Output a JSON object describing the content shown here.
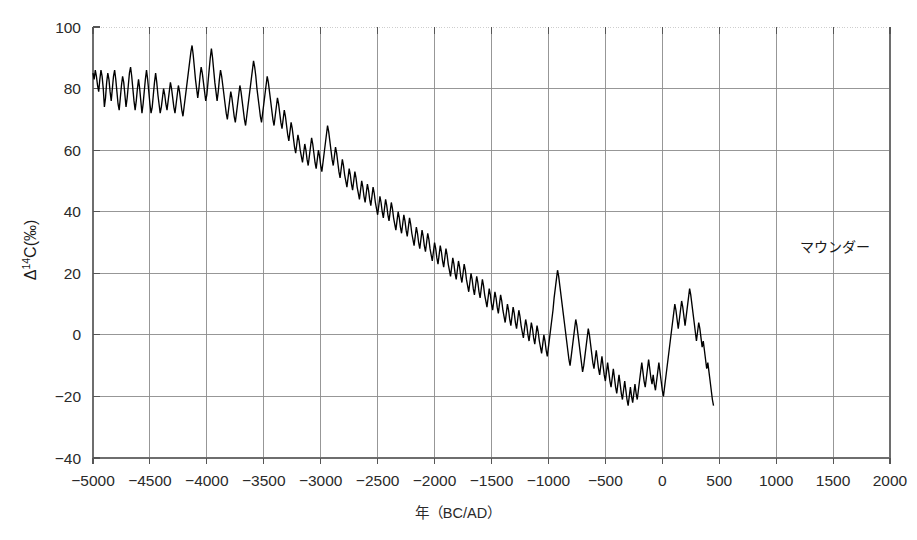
{
  "chart_data": {
    "type": "line",
    "title": "",
    "xlabel": "年（BC/AD）",
    "ylabel": "Δ14C(‰)",
    "ylabel_parts": {
      "delta": "Δ",
      "superscript": "14",
      "rest": "C(‰)"
    },
    "xlim": [
      -5000,
      2000
    ],
    "ylim": [
      -40,
      100
    ],
    "grid": true,
    "legend": false,
    "xtick_labels": [
      "−5000",
      "−4500",
      "−4000",
      "−3500",
      "−3000",
      "−2500",
      "−2000",
      "−1500",
      "−1000",
      "−500",
      "0",
      "500",
      "1000",
      "1500",
      "2000"
    ],
    "xtick_values": [
      -5000,
      -4500,
      -4000,
      -3500,
      -3000,
      -2500,
      -2000,
      -1500,
      -1000,
      -500,
      0,
      500,
      1000,
      1500,
      2000
    ],
    "ytick_labels": [
      "100",
      "80",
      "60",
      "40",
      "20",
      "0",
      "−20",
      "−40"
    ],
    "ytick_values": [
      100,
      80,
      60,
      40,
      20,
      0,
      -20,
      -40
    ],
    "annotations": [
      {
        "text": "マウンダー",
        "x": 1520,
        "y": 27,
        "name": "maunder-annotation"
      }
    ],
    "series": [
      {
        "name": "Delta-14C",
        "color": "#000000",
        "x_start": -5000,
        "x_step": 10,
        "values": [
          85,
          83,
          86,
          84,
          81,
          79,
          83,
          86,
          84,
          80,
          74,
          77,
          82,
          85,
          83,
          79,
          76,
          80,
          84,
          86,
          83,
          79,
          75,
          73,
          77,
          81,
          84,
          82,
          78,
          74,
          77,
          81,
          85,
          87,
          84,
          80,
          76,
          73,
          76,
          80,
          83,
          80,
          76,
          72,
          75,
          79,
          83,
          86,
          83,
          79,
          75,
          72,
          74,
          78,
          82,
          85,
          82,
          78,
          75,
          72,
          74,
          77,
          80,
          78,
          75,
          73,
          76,
          79,
          82,
          80,
          77,
          74,
          72,
          75,
          78,
          81,
          79,
          76,
          73,
          71,
          74,
          77,
          80,
          83,
          86,
          89,
          92,
          94,
          91,
          87,
          83,
          80,
          77,
          80,
          84,
          87,
          85,
          82,
          79,
          76,
          78,
          82,
          86,
          90,
          93,
          90,
          86,
          82,
          79,
          76,
          79,
          83,
          86,
          84,
          81,
          78,
          75,
          72,
          70,
          73,
          76,
          79,
          77,
          74,
          71,
          69,
          72,
          75,
          78,
          81,
          79,
          76,
          73,
          70,
          68,
          71,
          74,
          77,
          80,
          83,
          86,
          89,
          87,
          84,
          80,
          77,
          74,
          71,
          69,
          72,
          75,
          78,
          81,
          84,
          82,
          79,
          76,
          73,
          70,
          68,
          71,
          74,
          77,
          75,
          72,
          69,
          67,
          70,
          73,
          71,
          68,
          65,
          63,
          66,
          69,
          67,
          64,
          61,
          59,
          62,
          65,
          63,
          60,
          58,
          56,
          59,
          62,
          60,
          57,
          55,
          58,
          61,
          64,
          62,
          59,
          56,
          54,
          57,
          60,
          58,
          55,
          53,
          56,
          59,
          62,
          65,
          68,
          66,
          63,
          60,
          57,
          55,
          58,
          61,
          59,
          56,
          53,
          51,
          54,
          57,
          55,
          52,
          50,
          48,
          51,
          54,
          52,
          49,
          47,
          50,
          53,
          51,
          48,
          46,
          44,
          47,
          50,
          48,
          45,
          43,
          46,
          49,
          47,
          44,
          42,
          45,
          48,
          46,
          43,
          41,
          39,
          42,
          45,
          43,
          40,
          38,
          41,
          44,
          42,
          39,
          37,
          40,
          43,
          41,
          38,
          36,
          34,
          37,
          40,
          38,
          35,
          33,
          36,
          39,
          37,
          34,
          32,
          35,
          38,
          36,
          33,
          31,
          29,
          32,
          35,
          33,
          30,
          28,
          31,
          34,
          32,
          29,
          27,
          30,
          33,
          31,
          28,
          26,
          24,
          27,
          30,
          28,
          25,
          23,
          26,
          29,
          27,
          24,
          22,
          25,
          28,
          26,
          23,
          21,
          19,
          22,
          25,
          23,
          20,
          18,
          21,
          24,
          22,
          19,
          17,
          20,
          23,
          21,
          18,
          16,
          14,
          17,
          20,
          18,
          15,
          13,
          16,
          19,
          17,
          14,
          12,
          15,
          18,
          16,
          13,
          11,
          9,
          12,
          15,
          13,
          10,
          8,
          11,
          14,
          12,
          9,
          7,
          10,
          13,
          11,
          8,
          6,
          4,
          7,
          10,
          8,
          5,
          3,
          6,
          9,
          7,
          4,
          2,
          5,
          8,
          6,
          3,
          1,
          -1,
          2,
          5,
          3,
          0,
          -2,
          1,
          4,
          2,
          -1,
          -3,
          0,
          3,
          1,
          -2,
          -4,
          -6,
          -3,
          0,
          -2,
          -5,
          -7,
          -4,
          -1,
          2,
          5,
          8,
          12,
          15,
          18,
          21,
          19,
          16,
          13,
          10,
          7,
          4,
          1,
          -2,
          -5,
          -8,
          -10,
          -7,
          -4,
          -1,
          2,
          5,
          3,
          0,
          -3,
          -6,
          -9,
          -12,
          -10,
          -7,
          -4,
          -1,
          2,
          0,
          -3,
          -6,
          -9,
          -11,
          -8,
          -5,
          -8,
          -11,
          -13,
          -10,
          -7,
          -10,
          -13,
          -15,
          -12,
          -9,
          -12,
          -15,
          -17,
          -14,
          -11,
          -14,
          -17,
          -19,
          -16,
          -13,
          -16,
          -19,
          -21,
          -18,
          -15,
          -18,
          -21,
          -23,
          -20,
          -17,
          -20,
          -22,
          -19,
          -16,
          -19,
          -21,
          -18,
          -15,
          -12,
          -9,
          -12,
          -15,
          -17,
          -14,
          -11,
          -8,
          -11,
          -14,
          -16,
          -13,
          -16,
          -18,
          -15,
          -12,
          -9,
          -12,
          -15,
          -18,
          -20,
          -17,
          -14,
          -11,
          -8,
          -5,
          -2,
          1,
          4,
          7,
          10,
          8,
          5,
          2,
          5,
          8,
          11,
          9,
          6,
          3,
          6,
          9,
          12,
          15,
          13,
          10,
          7,
          4,
          1,
          -2,
          1,
          4,
          2,
          -1,
          -4,
          -2,
          -5,
          -8,
          -11,
          -9,
          -12,
          -15,
          -18,
          -21,
          -23
        ]
      }
    ]
  },
  "layout": {
    "plot": {
      "left": 93,
      "top": 27,
      "right": 890,
      "bottom": 458
    }
  }
}
